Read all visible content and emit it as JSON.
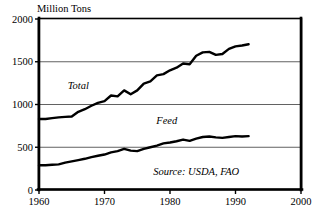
{
  "chart_data": {
    "type": "line",
    "title": "",
    "unit_label": "Million Tons",
    "xlabel": "",
    "ylabel": "Million Tons",
    "xlim": [
      1960,
      2000
    ],
    "ylim": [
      0,
      2000
    ],
    "xticks": [
      1960,
      1970,
      1980,
      1990,
      2000
    ],
    "xtick_labels": [
      "1960",
      "1970",
      "1980",
      "1990",
      "2000"
    ],
    "yticks": [
      0,
      500,
      1000,
      1500,
      2000
    ],
    "ytick_labels": [
      "0",
      "500",
      "1000",
      "1500",
      "2000"
    ],
    "grid": true,
    "grid_axis": "y",
    "legend_position": "inline-annotations",
    "source": "Source: USDA, FAO",
    "series": [
      {
        "name": "Total",
        "label": "Total",
        "color": "#000000",
        "x": [
          1960,
          1961,
          1962,
          1963,
          1964,
          1965,
          1966,
          1967,
          1968,
          1969,
          1970,
          1971,
          1972,
          1973,
          1974,
          1975,
          1976,
          1977,
          1978,
          1979,
          1980,
          1981,
          1982,
          1983,
          1984,
          1985,
          1986,
          1987,
          1988,
          1989,
          1990,
          1991,
          1992
        ],
        "values": [
          830,
          830,
          840,
          850,
          855,
          860,
          915,
          945,
          985,
          1020,
          1040,
          1105,
          1095,
          1165,
          1120,
          1165,
          1245,
          1270,
          1340,
          1355,
          1400,
          1430,
          1480,
          1470,
          1570,
          1610,
          1615,
          1580,
          1590,
          1650,
          1680,
          1690,
          1705
        ]
      },
      {
        "name": "Feed",
        "label": "Feed",
        "color": "#000000",
        "x": [
          1960,
          1961,
          1962,
          1963,
          1964,
          1965,
          1966,
          1967,
          1968,
          1969,
          1970,
          1971,
          1972,
          1973,
          1974,
          1975,
          1976,
          1977,
          1978,
          1979,
          1980,
          1981,
          1982,
          1983,
          1984,
          1985,
          1986,
          1987,
          1988,
          1989,
          1990,
          1991,
          1992
        ],
        "values": [
          290,
          290,
          295,
          300,
          320,
          335,
          350,
          365,
          385,
          400,
          415,
          440,
          455,
          480,
          460,
          455,
          480,
          500,
          520,
          545,
          555,
          570,
          590,
          575,
          600,
          620,
          625,
          615,
          610,
          620,
          630,
          625,
          630
        ]
      }
    ],
    "annotations": [
      {
        "text": "Total",
        "x": 1966,
        "y": 1180
      },
      {
        "text": "Feed",
        "x": 1979.5,
        "y": 770
      },
      {
        "text": "Source: USDA, FAO",
        "x": 1984,
        "y": 170
      }
    ]
  }
}
